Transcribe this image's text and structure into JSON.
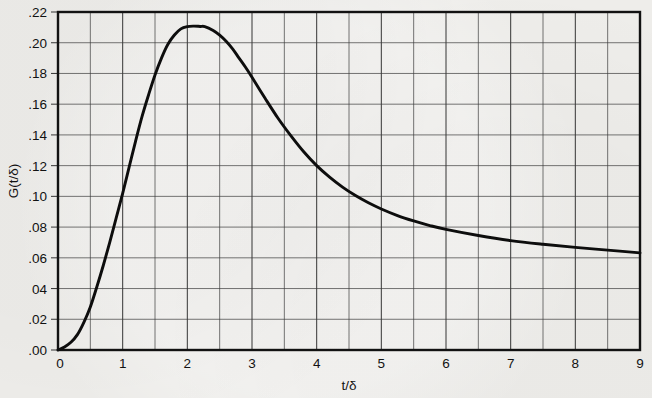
{
  "figure": {
    "background_color": "#eeedea",
    "ink_color": "#121212",
    "curve_color": "#0d0d0d",
    "grid_color": "#3b3b3b"
  },
  "axes": {
    "x_title": "t/δ",
    "y_title": "G(t/δ)",
    "x_tick_labels": [
      "0",
      "1",
      "2",
      "3",
      "4",
      "5",
      "6",
      "7",
      "8",
      "9"
    ],
    "y_tick_labels": [
      ".00",
      ".02",
      "04",
      ".06",
      ".08",
      ".10",
      ".12",
      ".14",
      ".16",
      ".18",
      ".20",
      ".22"
    ]
  },
  "chart_data": {
    "type": "line",
    "title": "",
    "subtitle": "",
    "xlabel": "t/δ",
    "ylabel": "G(t/δ)",
    "xlim": [
      0,
      9
    ],
    "ylim": [
      0.0,
      0.22
    ],
    "xticks": [
      0,
      1,
      2,
      3,
      4,
      5,
      6,
      7,
      8,
      9
    ],
    "yticks": [
      0.0,
      0.02,
      0.04,
      0.06,
      0.08,
      0.1,
      0.12,
      0.14,
      0.16,
      0.18,
      0.2,
      0.22
    ],
    "xtick_labels": [
      "0",
      "1",
      "2",
      "3",
      "4",
      "5",
      "6",
      "7",
      "8",
      "9"
    ],
    "ytick_labels": [
      ".00",
      ".02",
      "04",
      ".06",
      ".08",
      ".10",
      ".12",
      ".14",
      ".16",
      ".18",
      ".20",
      ".22"
    ],
    "grid": true,
    "grid_minor_x_step": 0.5,
    "grid_major_x_step": 1,
    "grid_y_step": 0.02,
    "legend": null,
    "legend_position": "none",
    "annotations": [],
    "peak": {
      "x": 2.27,
      "y": 0.2105
    },
    "series": [
      {
        "name": "G(t/δ)",
        "x": [
          0.0,
          0.1,
          0.2,
          0.3,
          0.4,
          0.5,
          0.6,
          0.7,
          0.8,
          0.9,
          1.0,
          1.1,
          1.2,
          1.3,
          1.4,
          1.5,
          1.6,
          1.7,
          1.8,
          1.9,
          2.0,
          2.1,
          2.2,
          2.27,
          2.4,
          2.5,
          2.6,
          2.7,
          2.8,
          2.9,
          3.0,
          3.2,
          3.4,
          3.6,
          3.8,
          4.0,
          4.2,
          4.4,
          4.6,
          4.8,
          5.0,
          5.25,
          5.5,
          5.75,
          6.0,
          6.5,
          7.0,
          7.5,
          8.0,
          8.5,
          9.0
        ],
        "y": [
          0.0,
          0.002,
          0.005,
          0.01,
          0.018,
          0.028,
          0.041,
          0.055,
          0.07,
          0.086,
          0.102,
          0.119,
          0.136,
          0.152,
          0.166,
          0.179,
          0.19,
          0.199,
          0.205,
          0.209,
          0.2105,
          0.2108,
          0.2106,
          0.2105,
          0.208,
          0.205,
          0.201,
          0.196,
          0.19,
          0.184,
          0.1775,
          0.164,
          0.151,
          0.1395,
          0.129,
          0.12,
          0.1125,
          0.106,
          0.1005,
          0.0958,
          0.0918,
          0.0875,
          0.084,
          0.081,
          0.0785,
          0.0745,
          0.0712,
          0.0688,
          0.0668,
          0.065,
          0.0632
        ]
      }
    ]
  },
  "geometry": {
    "plot_left": 58,
    "plot_right": 640,
    "plot_top": 12,
    "plot_bottom": 350
  }
}
